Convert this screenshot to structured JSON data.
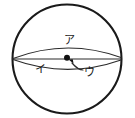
{
  "figure": {
    "kind": "circle-cross-section-diagram",
    "background_color": "#ffffff",
    "line_color": "#1a1a1a",
    "thin_line_color": "#2b2b2b",
    "width": 135,
    "height": 118,
    "circle": {
      "center_x": 67,
      "center_y": 59,
      "radius_x": 55,
      "radius_y": 55
    },
    "diameter_line": {
      "x1": 12,
      "y1": 59,
      "x2": 122,
      "y2": 59
    },
    "upper_arc": {
      "description": "arc bulging upward from left end of diameter to right end of diameter",
      "x1": 12,
      "y1": 59,
      "x2": 122,
      "y2": 59,
      "sag": 16
    },
    "lower_arc": {
      "description": "shallow arc bulging downward from left end of diameter to right end of diameter",
      "x1": 12,
      "y1": 59,
      "x2": 122,
      "y2": 59,
      "sag": 10
    },
    "center_dot": {
      "cx": 67,
      "cy": 58,
      "r": 3
    },
    "labels": [
      {
        "id": "label-a",
        "text": "ア",
        "romaji": "a",
        "x": 69,
        "y": 41,
        "points_to": "upper-arc"
      },
      {
        "id": "label-i",
        "text": "イ",
        "romaji": "i",
        "x": 40,
        "y": 70,
        "points_to": "lower-arc"
      },
      {
        "id": "label-u",
        "text": "ウ",
        "romaji": "u",
        "x": 89,
        "y": 73,
        "points_to": "center-dot"
      }
    ],
    "leaders": [
      {
        "id": "leader-u",
        "description": "curved leader from label u up-left to arrowhead at center dot",
        "from_x": 84,
        "from_y": 69,
        "to_x": 70,
        "to_y": 61
      }
    ]
  }
}
